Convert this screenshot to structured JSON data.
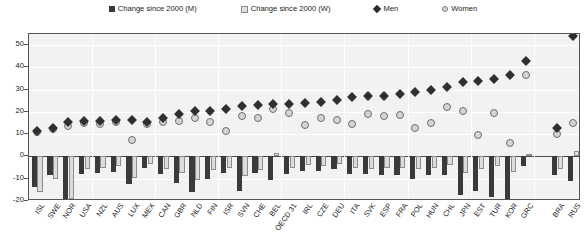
{
  "legend": {
    "items": [
      {
        "label": "Change since 2000 (M)",
        "marker": "filled-square-icon"
      },
      {
        "label": "Change since 2000 (W)",
        "marker": "open-square-icon"
      },
      {
        "label": "Men",
        "marker": "filled-diamond-icon"
      },
      {
        "label": "Women",
        "marker": "open-circle-icon"
      }
    ]
  },
  "chart_data": {
    "type": "bar",
    "title": "",
    "xlabel": "",
    "ylabel": "",
    "ylim": [
      -20,
      55
    ],
    "yticks": [
      -20,
      -10,
      0,
      10,
      20,
      30,
      40,
      50
    ],
    "grid": true,
    "legend_position": "top",
    "categories": [
      "ISL",
      "SWE",
      "NOR",
      "USA",
      "NZL",
      "AUS",
      "LUX",
      "MEX",
      "CAN",
      "GBR",
      "NLD",
      "FIN",
      "ISR",
      "SVN",
      "CHE",
      "BEL",
      "OECD 31",
      "IRL",
      "CZE",
      "DEU",
      "ITA",
      "SVK",
      "ESP",
      "FRA",
      "POL",
      "HUN",
      "CHL",
      "JPN",
      "EST",
      "TUR",
      "KOR",
      "GRC",
      "",
      "BRA",
      "RUS"
    ],
    "series": [
      {
        "name": "Change since 2000 (M)",
        "type": "bar",
        "values": [
          -13.5,
          -8.5,
          -19.5,
          -8.0,
          -7.5,
          -7.0,
          -12.5,
          -5.0,
          -8.0,
          -12.0,
          -16.0,
          -10.0,
          -7.5,
          -15.5,
          -7.5,
          -10.5,
          -8.0,
          -6.5,
          -6.5,
          -5.5,
          -8.0,
          -8.0,
          -8.5,
          -8.5,
          -10.0,
          -8.5,
          -8.5,
          -17.5,
          -15.5,
          -18.0,
          -19.5,
          -4.5,
          null,
          -8.5,
          -11.0
        ]
      },
      {
        "name": "Change since 2000 (W)",
        "type": "bar",
        "values": [
          -16.0,
          -10.0,
          -19.0,
          -5.5,
          -5.0,
          -4.5,
          -9.5,
          -3.5,
          -5.5,
          -7.5,
          -10.5,
          -6.0,
          -5.0,
          -9.0,
          -6.0,
          1.5,
          -5.0,
          -4.0,
          -4.5,
          -3.5,
          -5.0,
          -5.5,
          -5.0,
          -5.0,
          -5.5,
          -5.0,
          -4.0,
          -7.5,
          -5.5,
          -4.5,
          -7.0,
          1.0,
          null,
          -5.5,
          2.5
        ]
      },
      {
        "name": "Men",
        "type": "scatter",
        "values": [
          11.5,
          13.0,
          15.5,
          16.0,
          16.0,
          16.5,
          16.5,
          15.5,
          17.5,
          19.0,
          20.5,
          20.5,
          21.5,
          22.5,
          23.0,
          23.5,
          23.5,
          24.0,
          24.5,
          25.5,
          26.5,
          27.0,
          27.0,
          28.0,
          29.0,
          30.0,
          31.0,
          33.5,
          34.0,
          35.0,
          36.5,
          43.0,
          null,
          13.0,
          54.0
        ]
      },
      {
        "name": "Women",
        "type": "scatter",
        "values": [
          11.0,
          12.5,
          13.5,
          15.0,
          14.5,
          15.5,
          7.5,
          14.5,
          15.5,
          16.0,
          17.5,
          15.5,
          11.5,
          18.0,
          17.5,
          21.5,
          19.5,
          14.0,
          17.5,
          16.5,
          14.5,
          19.0,
          18.0,
          18.5,
          13.0,
          15.0,
          22.0,
          20.5,
          9.5,
          19.5,
          6.0,
          36.5,
          null,
          10.0,
          15.0
        ]
      }
    ]
  }
}
